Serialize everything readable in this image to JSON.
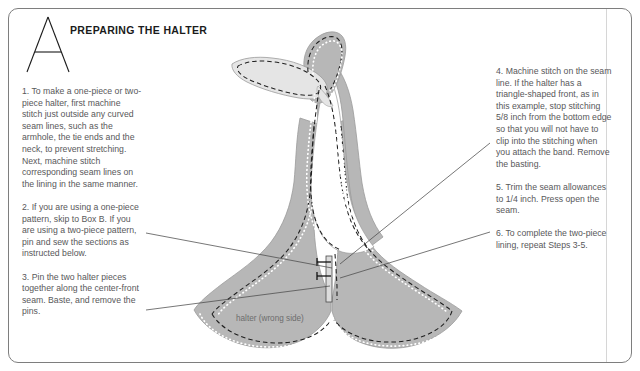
{
  "page": {
    "background_color": "#ffffff",
    "border_color": "#7e7e7e",
    "gutter_line_color": "#d6d6d6"
  },
  "header": {
    "drop_cap": "A",
    "title": "PREPARING THE HALTER",
    "title_color": "#1b1b1b"
  },
  "left_column": {
    "steps": [
      {
        "number": "1.",
        "text": "1. To make a one-piece or two-piece halter, first machine stitch just outside any curved seam lines, such as the armhole, the tie ends and the neck, to prevent stretching. Next, machine stitch corresponding seam lines on the lining in the same manner."
      },
      {
        "number": "2.",
        "text": "2. If you are using a one-piece pattern, skip to Box B. If you are using a two-piece pattern, pin and sew the sections as instructed below."
      },
      {
        "number": "3.",
        "text": "3. Pin the two halter pieces together along the center-front seam. Baste, and remove the pins."
      }
    ]
  },
  "right_column": {
    "steps": [
      {
        "number": "4.",
        "text": "4. Machine stitch on the seam line. If the halter has a triangle-shaped front, as in this example, stop stitching 5/8 inch from the bottom edge so that you will not have to clip into the stitching when you attach the band. Remove the basting."
      },
      {
        "number": "5.",
        "text": "5. Trim the seam allowances to 1/4 inch. Press open the seam."
      },
      {
        "number": "6.",
        "text": "6. To complete the two-piece lining, repeat Steps 3-5."
      }
    ]
  },
  "illustration": {
    "caption": "halter (wrong side)",
    "caption_color": "#6d6d6d",
    "fabric_fill": "#b7b7b7",
    "fabric_edge": "#9a9a9a",
    "lining_fill": "#e3e3e3",
    "stitch_dashed_color": "#1f1f1f",
    "basting_dotted_color": "#ffffff",
    "leader_line_color": "#4a4a4a",
    "parts": [
      "tie-end-left",
      "tie-end-right",
      "neck-loop",
      "halter-body-left",
      "halter-body-right",
      "center-front-seam"
    ],
    "leader_lines": [
      {
        "name": "leader-step-3",
        "from": "left-column-step-3",
        "to": "center-front-seam-lower"
      },
      {
        "name": "leader-step-3b",
        "from": "left-column-step-2",
        "to": "halter-left-edge"
      },
      {
        "name": "leader-step-4",
        "from": "right-column-step-4",
        "to": "center-front-seam-upper"
      },
      {
        "name": "leader-step-5",
        "from": "right-column-step-5",
        "to": "center-front-seam-allowance"
      }
    ]
  }
}
